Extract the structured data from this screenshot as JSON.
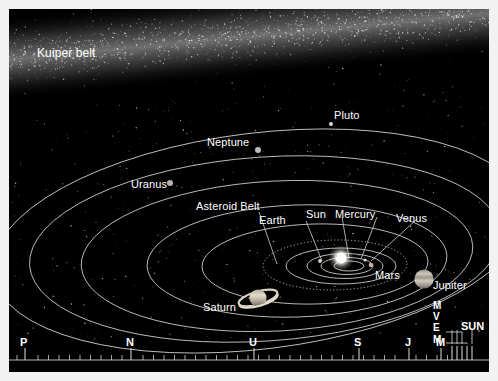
{
  "diagram": {
    "background_color": "#000000",
    "frame_color": "#f2f2f2",
    "orbit_line_color": "#c9c9c9",
    "label_color": "#ffffff"
  },
  "labels": {
    "kuiper_belt": "Kuiper belt",
    "pluto": "Pluto",
    "neptune": "Neptune",
    "uranus": "Uranus",
    "asteroid_belt": "Asteroid Belt",
    "earth": "Earth",
    "sun": "Sun",
    "mercury": "Mercury",
    "venus": "Venus",
    "mars": "Mars",
    "jupiter": "Jupiter",
    "saturn": "Saturn"
  },
  "bodies": [
    {
      "name": "Pluto",
      "x": 331,
      "y": 124,
      "r": 1.8,
      "color": "#d8d8d8",
      "type": "dot"
    },
    {
      "name": "Neptune",
      "x": 258,
      "y": 150,
      "r": 3.0,
      "color": "#b8b8b8",
      "type": "dot"
    },
    {
      "name": "Uranus",
      "x": 170,
      "y": 183,
      "r": 3.0,
      "color": "#b0b0b0",
      "type": "dot"
    },
    {
      "name": "Saturn",
      "x": 258,
      "y": 298,
      "r": 9.0,
      "color": "#cfc8b8",
      "type": "ringed"
    },
    {
      "name": "Jupiter",
      "x": 424,
      "y": 279,
      "r": 9.5,
      "color": "#b9b4ab",
      "type": "banded"
    },
    {
      "name": "Mars",
      "x": 371,
      "y": 265,
      "r": 2.2,
      "color": "#c8b0a0",
      "type": "dot"
    },
    {
      "name": "Sun",
      "x": 341,
      "y": 258,
      "r": 6.0,
      "color": "#ffffff",
      "type": "star"
    }
  ],
  "scale": {
    "caption_ticks": "logarithmic distance scale",
    "major": [
      {
        "label": "P",
        "x": 16
      },
      {
        "label": "N",
        "x": 122
      },
      {
        "label": "U",
        "x": 245
      },
      {
        "label": "S",
        "x": 350
      },
      {
        "label": "J",
        "x": 400
      },
      {
        "label": "M",
        "x": 432
      }
    ],
    "inner": [
      {
        "label": "M",
        "x": 443
      },
      {
        "label": "V",
        "x": 448
      },
      {
        "label": "E",
        "x": 453
      },
      {
        "label": "M",
        "x": 458
      }
    ],
    "sun_label": "SUN",
    "sun_label_x": 463
  }
}
